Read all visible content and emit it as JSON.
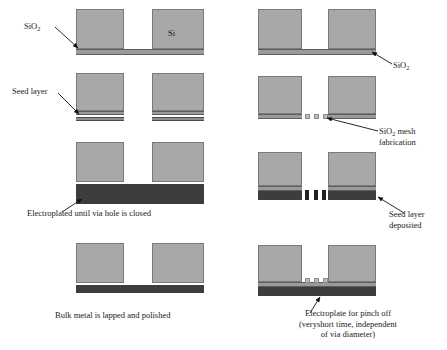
{
  "figure": {
    "colors": {
      "silicon": "#a8a8a8",
      "sio2": "#9a9a9a",
      "seed": "#8e8e8e",
      "plated_metal": "#3d3d3d",
      "mesh_light": "#bdbdbd",
      "mesh_dark": "#222222",
      "background": "#ffffff",
      "text": "#1a1a1a"
    }
  },
  "left_column": {
    "step1": {
      "label_sio2": "SiO",
      "label_sio2_sub": "2",
      "label_si": "Si"
    },
    "step2": {
      "label_seed": "Seed layer"
    },
    "step3": {
      "caption": "Electroplated until via hole is closed"
    },
    "step4": {
      "caption": "Bulk metal is lapped and polished"
    }
  },
  "right_column": {
    "step1": {
      "label_sio2": "SiO",
      "label_sio2_sub": "2"
    },
    "step2": {
      "label_mesh_line1": "SiO",
      "label_mesh_sub": "2",
      "label_mesh_line1_rest": " mesh",
      "label_mesh_line2": "fabrication"
    },
    "step3": {
      "label_seed_line1": "Seed layer",
      "label_seed_line2": "deposited"
    },
    "step4": {
      "caption_line1": "Electroplate for pinch off",
      "caption_line2": "(veryshort time, independent",
      "caption_line3": "of via diameter)"
    }
  }
}
